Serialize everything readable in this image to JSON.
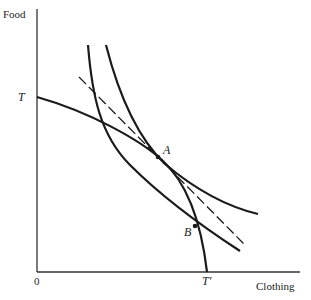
{
  "diagram": {
    "type": "economics-ppf-indifference",
    "axes": {
      "y_label": "Food",
      "x_label": "Clothing",
      "origin_label": "0"
    },
    "curve_labels": {
      "ppf_start": "T",
      "ppf_end": "T′"
    },
    "points": [
      {
        "label": "A",
        "x": 158,
        "y": 157
      },
      {
        "label": "B",
        "x": 195,
        "y": 226
      }
    ],
    "colors": {
      "line": "#1a1a1a",
      "background": "#ffffff"
    }
  }
}
